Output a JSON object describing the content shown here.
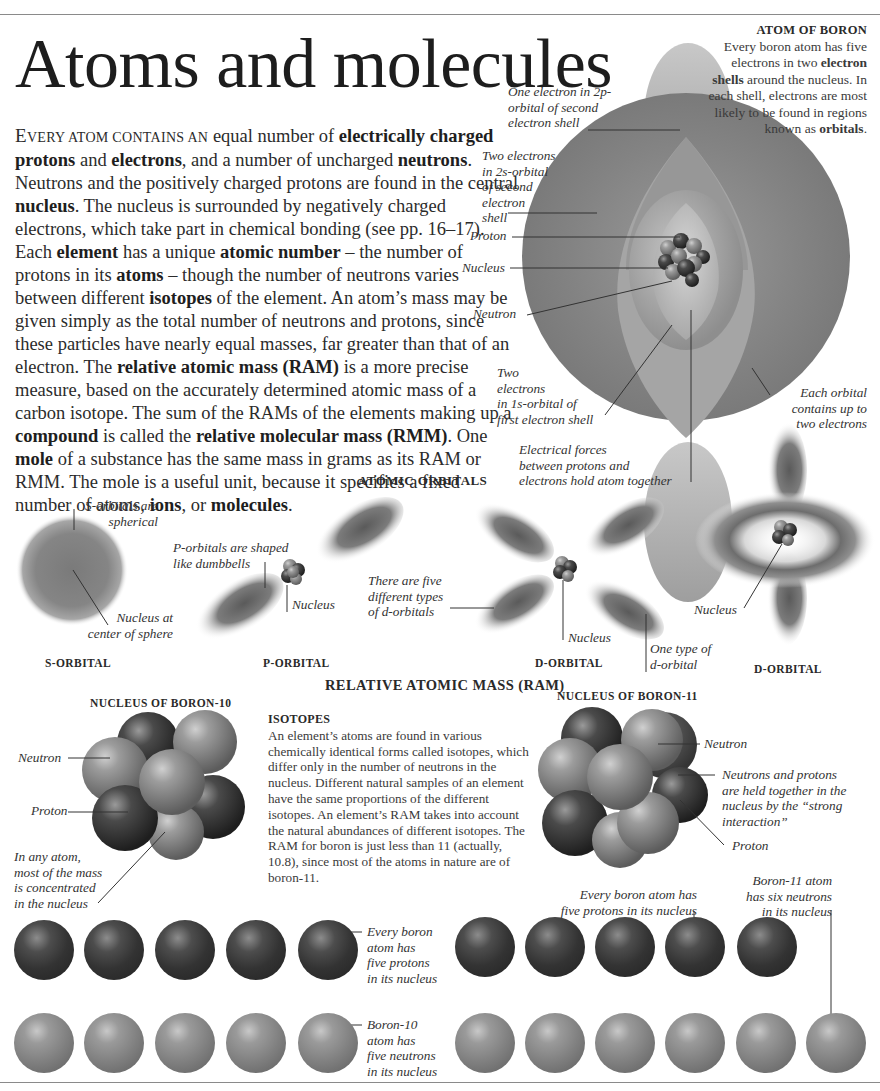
{
  "page": {
    "title": "Atoms and molecules",
    "intro": {
      "lead_cap": "E",
      "lead_smallcaps": "VERY ATOM CONTAINS AN",
      "segments": [
        {
          "t": " equal number of "
        },
        {
          "b": "electrically charged protons"
        },
        {
          "t": " and "
        },
        {
          "b": "electrons"
        },
        {
          "t": ", and a number of uncharged "
        },
        {
          "b": "neutrons"
        },
        {
          "t": ". Neutrons and the positively charged protons are found in the central "
        },
        {
          "b": "nucleus"
        },
        {
          "t": ". The nucleus is surrounded by negatively charged electrons, which take part in chemical bonding (see pp. 16–17). Each "
        },
        {
          "b": "element"
        },
        {
          "t": " has a unique "
        },
        {
          "b": "atomic number"
        },
        {
          "t": " – the number of protons in its "
        },
        {
          "b": "atoms"
        },
        {
          "t": " – though the number of neutrons varies between different "
        },
        {
          "b": "isotopes"
        },
        {
          "t": " of the element. An atom’s mass may be given simply as the total number of neutrons and protons, since these particles have nearly equal masses, far greater than that of an electron. The "
        },
        {
          "b": "relative atomic mass (RAM)"
        },
        {
          "t": " is a more precise measure, based on the accurately determined atomic mass of a carbon isotope. The sum of the RAMs of the elements making up a "
        },
        {
          "b": "compound"
        },
        {
          "t": " is called the "
        },
        {
          "b": "relative molecular mass (RMM)"
        },
        {
          "t": ". One "
        },
        {
          "b": "mole"
        },
        {
          "t": " of a substance has the same mass in grams as its RAM or RMM. The mole is a useful unit, because it specifies a fixed number of atoms, "
        },
        {
          "b": "ions"
        },
        {
          "t": ", or "
        },
        {
          "b": "molecules"
        },
        {
          "t": "."
        }
      ]
    }
  },
  "atom_of_boron": {
    "heading": "ATOM OF BORON",
    "text_1": "Every boron atom has five electrons in two ",
    "bold_1": "electron shells",
    "text_2": " around the nucleus. In each shell, electrons are most likely to be found in regions known as ",
    "bold_2": "orbitals",
    "text_3": ".",
    "labels": {
      "electron_2p": [
        "One electron in 2p-",
        "orbital of second",
        "electron shell"
      ],
      "electrons_2s": [
        "Two electrons",
        "in 2s-orbital",
        "of second",
        "electron",
        "shell"
      ],
      "proton": "Proton",
      "nucleus": "Nucleus",
      "neutron": "Neutron",
      "electrons_1s": [
        "Two",
        "electrons",
        "in 1s-orbital of",
        "first electron shell"
      ],
      "electrical_forces": [
        "Electrical forces",
        "between protons and",
        "electrons hold atom together"
      ],
      "each_orbital": [
        "Each orbital",
        "contains up to",
        "two electrons"
      ]
    }
  },
  "atomic_orbitals": {
    "heading": "ATOMIC ORBITALS",
    "s_orbital": {
      "caption": "S-ORBITAL",
      "label_top": [
        "S-orbitals are",
        "spherical"
      ],
      "label_bottom": [
        "Nucleus at",
        "center of sphere"
      ]
    },
    "p_orbital": {
      "caption": "P-ORBITAL",
      "label_shape": [
        "P-orbitals are shaped",
        "like dumbbells"
      ],
      "label_nucleus": "Nucleus"
    },
    "d_orbital_1": {
      "caption": "D-ORBITAL",
      "label_types": [
        "There are five",
        "different types",
        "of d-orbitals"
      ],
      "label_nucleus": "Nucleus",
      "label_one_type": [
        "One type of",
        "d-orbital"
      ]
    },
    "d_orbital_2": {
      "caption": "D-ORBITAL",
      "label_nucleus": "Nucleus"
    }
  },
  "ram": {
    "heading": "RELATIVE ATOMIC MASS (RAM)",
    "boron10": {
      "caption": "NUCLEUS OF BORON-10",
      "label_neutron": "Neutron",
      "label_proton": "Proton",
      "label_mass": [
        "In any atom,",
        "most of the mass",
        "is concentrated",
        "in the nucleus"
      ]
    },
    "isotopes": {
      "heading": "ISOTOPES",
      "text": "An element’s atoms are found in various chemically identical forms called isotopes, which differ only in the number of neutrons in the nucleus. Different natural samples of an element have the same proportions of the different isotopes. An element’s RAM takes into account the natural abundances of different isotopes. The RAM for boron is just less than 11 (actually, 10.8), since most of the atoms in nature are of boron-11."
    },
    "boron11": {
      "caption": "NUCLEUS OF BORON-11",
      "label_neutron": "Neutron",
      "label_strong": [
        "Neutrons and protons",
        "are held together in the",
        "nucleus by the “strong",
        "interaction”"
      ],
      "label_proton": "Proton"
    }
  },
  "particle_rows": {
    "boron10": {
      "protons": 5,
      "neutrons": 5,
      "label_protons": [
        "Every boron",
        "atom has",
        "five protons",
        "in its nucleus"
      ],
      "label_neutrons": [
        "Boron-10",
        "atom has",
        "five neutrons",
        "in its nucleus"
      ]
    },
    "boron11": {
      "protons": 5,
      "neutrons": 6,
      "label_protons": [
        "Every boron atom has",
        "five protons in its nucleus"
      ],
      "label_neutrons": [
        "Boron-11 atom",
        "has six neutrons",
        "in its nucleus"
      ]
    }
  }
}
